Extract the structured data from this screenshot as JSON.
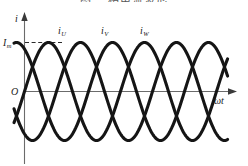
{
  "figure": {
    "title": "图 三相电流波形",
    "background": "#ffffff",
    "curve_color": "#151515",
    "axis_color": "#6b6b6b"
  },
  "axes": {
    "y_axis_label": "i",
    "x_axis_label_omega": "ω",
    "x_axis_label_t": "t",
    "origin_label": "O",
    "amplitude_label_main": "I",
    "amplitude_label_sub": "m"
  },
  "curves": [
    {
      "name": "iU",
      "label_main": "i",
      "label_sub": "U",
      "phase_deg": 0,
      "label_x": 58,
      "label_y": 33
    },
    {
      "name": "iV",
      "label_main": "i",
      "label_sub": "V",
      "phase_deg": 120,
      "label_x": 101,
      "label_y": 33
    },
    {
      "name": "iW",
      "label_main": "i",
      "label_sub": "W",
      "phase_deg": 240,
      "label_x": 140,
      "label_y": 33
    }
  ],
  "chart_data": {
    "type": "line",
    "title": "三相电流波形",
    "xlabel": "ωt",
    "ylabel": "i",
    "grid": false,
    "legend": "inline-labels",
    "amplitude": 1.0,
    "amplitude_tick_label": "Im",
    "period_px": 96,
    "x_range_deg": [
      -70,
      810
    ],
    "ylim": [
      -1.15,
      1.15
    ],
    "series": [
      {
        "name": "iU",
        "phase_deg": 0,
        "formula": "Im*sin(wt)"
      },
      {
        "name": "iV",
        "phase_deg": 120,
        "formula": "Im*sin(wt-120)"
      },
      {
        "name": "iW",
        "phase_deg": 240,
        "formula": "Im*sin(wt-240)"
      }
    ],
    "annotations": [
      {
        "text": "Im",
        "type": "y-level-dashed",
        "value": 1.0
      },
      {
        "text": "O",
        "type": "origin"
      }
    ]
  }
}
